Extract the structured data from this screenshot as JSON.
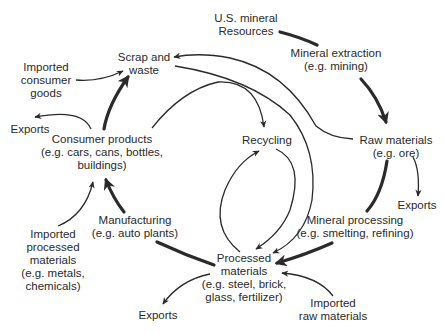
{
  "colors": {
    "ink": "#2a2a2a",
    "background": "#ffffff"
  },
  "nodes": {
    "us_mineral_resources": {
      "lines": [
        "U.S. mineral",
        "Resources"
      ]
    },
    "mineral_extraction": {
      "lines": [
        "Mineral extraction",
        "(e.g. mining)"
      ]
    },
    "raw_materials": {
      "lines": [
        "Raw materials",
        "(e.g. ore)"
      ]
    },
    "exports_raw": {
      "lines": [
        "Exports"
      ]
    },
    "mineral_processing": {
      "lines": [
        "Mineral processing",
        "(e.g. smelting, refining)"
      ]
    },
    "processed_materials": {
      "lines": [
        "Processed",
        "materials",
        "(e.g. steel, brick,",
        "glass, fertilizer)"
      ]
    },
    "imported_raw_materials": {
      "lines": [
        "Imported",
        "raw materials"
      ]
    },
    "exports_processed": {
      "lines": [
        "Exports"
      ]
    },
    "manufacturing": {
      "lines": [
        "Manufacturing",
        "(e.g. auto plants)"
      ]
    },
    "imported_processed_materials": {
      "lines": [
        "Imported",
        "processed",
        "materials",
        "(e.g. metals,",
        "chemicals)"
      ]
    },
    "consumer_products": {
      "lines": [
        "Consumer products",
        "(e.g. cars, cans, bottles,",
        "buildings)"
      ]
    },
    "exports_consumer": {
      "lines": [
        "Exports"
      ]
    },
    "imported_consumer_goods": {
      "lines": [
        "Imported",
        "consumer",
        "goods"
      ]
    },
    "scrap_and_waste": {
      "lines": [
        "Scrap and",
        "waste"
      ]
    },
    "recycling": {
      "lines": [
        "Recycling"
      ]
    }
  },
  "edges": [
    {
      "from": "U.S. mineral Resources",
      "to": "Mineral extraction",
      "weight": "thick"
    },
    {
      "from": "Mineral extraction",
      "to": "Raw materials",
      "weight": "thick"
    },
    {
      "from": "Raw materials",
      "to": "Exports",
      "weight": "thin"
    },
    {
      "from": "Raw materials",
      "to": "Mineral processing",
      "weight": "thick"
    },
    {
      "from": "Raw materials",
      "to": "Scrap and waste",
      "weight": "thin"
    },
    {
      "from": "Mineral processing",
      "to": "Processed materials",
      "weight": "thick"
    },
    {
      "from": "Imported raw materials",
      "to": "Processed materials",
      "weight": "thin"
    },
    {
      "from": "Processed materials",
      "to": "Exports",
      "weight": "thin"
    },
    {
      "from": "Processed materials",
      "to": "Manufacturing",
      "weight": "thick"
    },
    {
      "from": "Processed materials",
      "to": "Recycling",
      "weight": "thin"
    },
    {
      "from": "Recycling",
      "to": "Processed materials",
      "weight": "thin"
    },
    {
      "from": "Manufacturing",
      "to": "Consumer products",
      "weight": "thick"
    },
    {
      "from": "Imported processed materials",
      "to": "Consumer products",
      "weight": "thin"
    },
    {
      "from": "Consumer products",
      "to": "Exports",
      "weight": "thin"
    },
    {
      "from": "Consumer products",
      "to": "Scrap and waste",
      "weight": "thick"
    },
    {
      "from": "Consumer products",
      "to": "Recycling",
      "weight": "thin"
    },
    {
      "from": "Imported consumer goods",
      "to": "Scrap and waste",
      "weight": "thin"
    },
    {
      "from": "Scrap and waste",
      "to": "Processed materials",
      "weight": "thin"
    }
  ]
}
